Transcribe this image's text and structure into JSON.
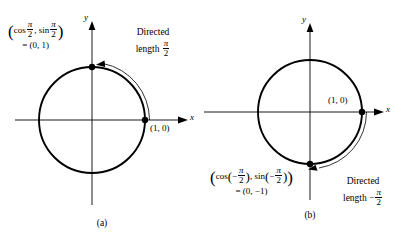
{
  "figure": {
    "type": "unit-circle-directed-arc-diagram",
    "background": "#ffffff",
    "stroke_color": "#000000"
  },
  "panels": [
    {
      "id": "a",
      "caption": "(a)",
      "axes": {
        "x_label": "x",
        "y_label": "y"
      },
      "circle": {
        "cx": 92,
        "cy": 120,
        "r": 53,
        "radius_value": 1
      },
      "points": [
        {
          "name": "terminal-point",
          "label_line1_prefix": "(",
          "x": 0,
          "y": 1
        },
        {
          "name": "initial-point",
          "label": "(1, 0)",
          "x": 1,
          "y": 0
        }
      ],
      "terminal_label": {
        "cos_text": "cos",
        "sin_text": "sin",
        "pi": "π",
        "denominator": "2",
        "negative": false,
        "equals_line": "= (0, 1)"
      },
      "initial_label": "(1, 0)",
      "annotation": {
        "line1": "Directed",
        "line2_prefix": "length",
        "sign": "",
        "pi": "π",
        "denominator": "2"
      },
      "arc": {
        "from_angle_deg": 0,
        "to_angle_deg": 90,
        "direction": "counterclockwise",
        "arrow_at": "end"
      }
    },
    {
      "id": "b",
      "caption": "(b)",
      "axes": {
        "x_label": "x",
        "y_label": "y"
      },
      "circle": {
        "cx": 106,
        "cy": 112,
        "r": 52,
        "radius_value": 1
      },
      "points": [
        {
          "name": "terminal-point",
          "x": 0,
          "y": -1
        },
        {
          "name": "initial-point",
          "label": "(1, 0)",
          "x": 1,
          "y": 0
        }
      ],
      "terminal_label": {
        "cos_text": "cos",
        "sin_text": "sin",
        "pi": "π",
        "denominator": "2",
        "negative": true,
        "minus": "−",
        "equals_line": "= (0, −1)"
      },
      "initial_label": "(1, 0)",
      "annotation": {
        "line1": "Directed",
        "line2_prefix": "length",
        "sign": "−",
        "pi": "π",
        "denominator": "2"
      },
      "arc": {
        "from_angle_deg": 0,
        "to_angle_deg": -90,
        "direction": "clockwise",
        "arrow_at": "end"
      }
    }
  ]
}
